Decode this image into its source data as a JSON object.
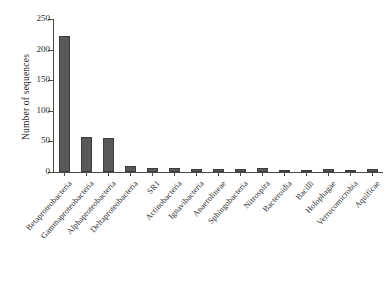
{
  "chart_data": {
    "type": "bar",
    "title": "",
    "xlabel": "",
    "ylabel": "Number of sequences",
    "ylim": [
      0,
      250
    ],
    "yticks": [
      0,
      50,
      100,
      150,
      200,
      250
    ],
    "grid": false,
    "legend": null,
    "bar_color": "#595959",
    "bar_edge_color": "#3d3d3d",
    "axis_color": "#4a4a4a",
    "xtick_rotation": -48,
    "categories": [
      "Betaproteobacteria",
      "Gammaproteobacteria",
      "Alphaproteobacteria",
      "Deltaproteobacteria",
      "SR1",
      "Actinobacteria",
      "Ignavibacteria",
      "Anaerolineae",
      "Sphingobacteria",
      "Nitrospira",
      "Bacteroidia",
      "Bacilli",
      "Holophagae",
      "Verrucomicrobia",
      "Aquificae"
    ],
    "values": [
      222,
      58,
      55,
      10,
      6,
      7,
      5,
      5,
      5,
      6,
      4,
      4,
      5,
      3,
      5
    ]
  }
}
